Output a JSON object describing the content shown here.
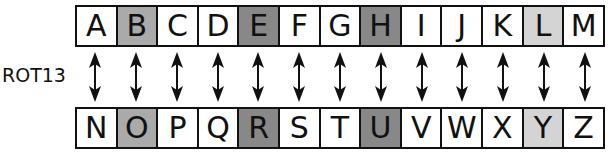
{
  "label": "ROT13",
  "colors": {
    "white": "#ffffff",
    "mid": "#aaaaaa",
    "dark": "#888888",
    "light": "#d4d4d4"
  },
  "top_row": [
    {
      "letter": "A",
      "shade": "white"
    },
    {
      "letter": "B",
      "shade": "mid"
    },
    {
      "letter": "C",
      "shade": "white"
    },
    {
      "letter": "D",
      "shade": "white"
    },
    {
      "letter": "E",
      "shade": "dark"
    },
    {
      "letter": "F",
      "shade": "white"
    },
    {
      "letter": "G",
      "shade": "white"
    },
    {
      "letter": "H",
      "shade": "dark"
    },
    {
      "letter": "I",
      "shade": "white"
    },
    {
      "letter": "J",
      "shade": "white"
    },
    {
      "letter": "K",
      "shade": "white"
    },
    {
      "letter": "L",
      "shade": "light"
    },
    {
      "letter": "M",
      "shade": "white"
    }
  ],
  "bottom_row": [
    {
      "letter": "N",
      "shade": "white"
    },
    {
      "letter": "O",
      "shade": "mid"
    },
    {
      "letter": "P",
      "shade": "white"
    },
    {
      "letter": "Q",
      "shade": "white"
    },
    {
      "letter": "R",
      "shade": "dark"
    },
    {
      "letter": "S",
      "shade": "white"
    },
    {
      "letter": "T",
      "shade": "white"
    },
    {
      "letter": "U",
      "shade": "dark"
    },
    {
      "letter": "V",
      "shade": "white"
    },
    {
      "letter": "W",
      "shade": "white"
    },
    {
      "letter": "X",
      "shade": "white"
    },
    {
      "letter": "Y",
      "shade": "light"
    },
    {
      "letter": "Z",
      "shade": "white"
    }
  ],
  "arrow_icon": "double-headed-vertical-arrow"
}
